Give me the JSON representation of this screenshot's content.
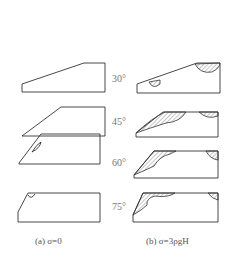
{
  "figure": {
    "angles": [
      "30°",
      "45°",
      "60°",
      "75°"
    ],
    "captions": {
      "a": "(a) σ=0",
      "b": "(b) σ=3ρgH"
    },
    "colors": {
      "stroke": "#333333",
      "hatch": "#555555",
      "label": "#777777"
    }
  }
}
